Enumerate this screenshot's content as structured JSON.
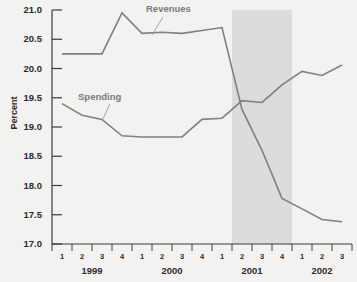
{
  "chart_data": {
    "type": "line",
    "title": "",
    "xlabel": "",
    "ylabel": "Percent",
    "ylim": [
      17.0,
      21.0
    ],
    "ytick_labels": [
      "21.0",
      "20.5",
      "20.0",
      "19.5",
      "19.0",
      "18.5",
      "18.0",
      "17.5",
      "17.0"
    ],
    "ytick_values": [
      21.0,
      20.5,
      20.0,
      19.5,
      19.0,
      18.5,
      18.0,
      17.5,
      17.0
    ],
    "grid": false,
    "legend_position": "inline-annotations",
    "x": [
      "1999 Q1",
      "1999 Q2",
      "1999 Q3",
      "1999 Q4",
      "2000 Q1",
      "2000 Q2",
      "2000 Q3",
      "2000 Q4",
      "2001 Q1",
      "2001 Q2",
      "2001 Q3",
      "2001 Q4",
      "2002 Q1",
      "2002 Q2",
      "2002 Q3"
    ],
    "quarter_labels": [
      "1",
      "2",
      "3",
      "4",
      "1",
      "2",
      "3",
      "4",
      "1",
      "2",
      "3",
      "4",
      "1",
      "2",
      "3"
    ],
    "year_groups": [
      {
        "label": "1999",
        "start_index": 0,
        "end_index": 3
      },
      {
        "label": "2000",
        "start_index": 4,
        "end_index": 7
      },
      {
        "label": "2001",
        "start_index": 8,
        "end_index": 11
      },
      {
        "label": "2002",
        "start_index": 12,
        "end_index": 14
      }
    ],
    "series": [
      {
        "name": "Revenues",
        "color": "#808080",
        "values": [
          20.25,
          20.25,
          20.25,
          20.95,
          20.6,
          20.62,
          20.6,
          20.65,
          20.7,
          19.3,
          18.6,
          17.78,
          17.6,
          17.42,
          17.38
        ]
      },
      {
        "name": "Spending",
        "color": "#808080",
        "values": [
          19.4,
          19.2,
          19.13,
          18.85,
          18.83,
          18.83,
          18.83,
          19.13,
          19.15,
          19.45,
          19.42,
          19.72,
          19.95,
          19.88,
          20.06
        ]
      }
    ],
    "annotations": [
      {
        "name": "revenues-label",
        "text": "Revenues"
      },
      {
        "name": "spending-label",
        "text": "Spending"
      }
    ],
    "shaded_region": {
      "label": "",
      "color": "#dcdcdc",
      "start": "2001 Q2",
      "end": "2001 Q4"
    }
  }
}
